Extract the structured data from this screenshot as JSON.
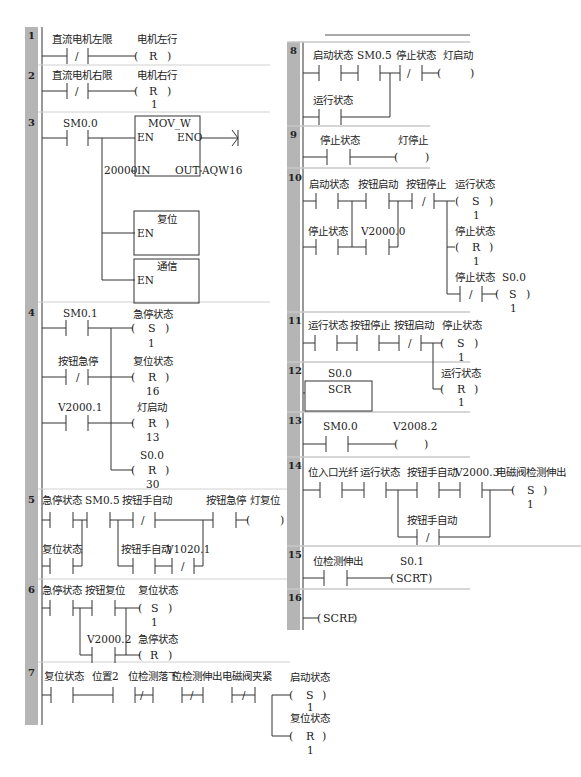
{
  "colors": {
    "gutter": "#b5b5b5",
    "wire": "#333333",
    "text": "#222222",
    "separator": "#c8c8c8"
  },
  "networks": [
    {
      "n": "1",
      "x": 25,
      "y": 27,
      "elements": [
        {
          "type": "contact_nc",
          "label": "直流电机左限",
          "x": 65,
          "y": 45
        },
        {
          "type": "coil",
          "op": "R",
          "label": "电机左行",
          "x": 140,
          "y": 45,
          "param": ""
        }
      ]
    },
    {
      "n": "2",
      "x": 25,
      "y": 67,
      "elements": [
        {
          "type": "contact_nc",
          "label": "直流电机右限",
          "x": 65,
          "y": 88
        },
        {
          "type": "coil",
          "op": "R",
          "label": "电机右行",
          "x": 140,
          "y": 88,
          "param": "1"
        }
      ]
    },
    {
      "n": "3",
      "x": 25,
      "y": 115
    },
    {
      "n": "4",
      "x": 25,
      "y": 305
    },
    {
      "n": "5",
      "x": 25,
      "y": 492
    },
    {
      "n": "6",
      "x": 25,
      "y": 582
    },
    {
      "n": "7",
      "x": 25,
      "y": 665
    },
    {
      "n": "8",
      "x": 287,
      "y": 45
    },
    {
      "n": "9",
      "x": 287,
      "y": 130
    },
    {
      "n": "10",
      "x": 287,
      "y": 175
    },
    {
      "n": "11",
      "x": 287,
      "y": 318
    },
    {
      "n": "12",
      "x": 287,
      "y": 369
    },
    {
      "n": "13",
      "x": 287,
      "y": 419
    },
    {
      "n": "14",
      "x": 287,
      "y": 464
    },
    {
      "n": "15",
      "x": 287,
      "y": 553
    },
    {
      "n": "16",
      "x": 287,
      "y": 596
    }
  ],
  "labels": {
    "n1_contact": "直流电机左限",
    "n1_coil": "电机左行",
    "n1_op": "R",
    "n2_contact": "直流电机右限",
    "n2_coil": "电机右行",
    "n2_op": "R",
    "n2_param": "1",
    "n3_contact": "SM0.0",
    "n3_box1_title": "MOV_W",
    "n3_en": "EN",
    "n3_eno": "ENO",
    "n3_in": "IN",
    "n3_out": "OUT",
    "n3_in_val": "20000",
    "n3_out_val": "AQW16",
    "n3_box2_title": "复位",
    "n3_box3_title": "通信",
    "n4_c1": "SM0.1",
    "n4_c2": "按钮急停",
    "n4_c3": "V2000.1",
    "n4_o1": "急停状态",
    "n4_o1_op": "S",
    "n4_o1_p": "1",
    "n4_o2": "复位状态",
    "n4_o2_op": "R",
    "n4_o2_p": "16",
    "n4_o3": "灯启动",
    "n4_o3_op": "R",
    "n4_o3_p": "13",
    "n4_o4": "S0.0",
    "n4_o4_op": "R",
    "n4_o4_p": "30",
    "n5_c1": "急停状态",
    "n5_c2": "SM0.5",
    "n5_c3": "按钮手自动",
    "n5_c4": "按钮急停",
    "n5_coil": "灯复位",
    "n5_c5": "复位状态",
    "n5_c6": "按钮手自动",
    "n5_c7": "V1020.1",
    "n6_c1": "急停状态",
    "n6_c2": "按钮复位",
    "n6_c3": "V2000.2",
    "n6_o1": "复位状态",
    "n6_o1_op": "S",
    "n6_o1_p": "1",
    "n6_o2": "急停状态",
    "n6_o2_op": "R",
    "n7_c1": "复位状态",
    "n7_c2": "位置2",
    "n7_c3": "位检测落下",
    "n7_c4": "位检测伸出",
    "n7_c5": "电磁阀夹紧",
    "n7_o1": "启动状态",
    "n7_o1_op": "S",
    "n7_o1_p": "1",
    "n7_o2": "复位状态",
    "n7_o2_op": "R",
    "n7_o2_p": "1",
    "n8_c1": "启动状态",
    "n8_c2": "SM0.5",
    "n8_c3": "停止状态",
    "n8_coil": "灯启动",
    "n8_c4": "运行状态",
    "n9_c1": "停止状态",
    "n9_coil": "灯停止",
    "n10_c1": "启动状态",
    "n10_c2": "按钮启动",
    "n10_c3": "按钮停止",
    "n10_c4": "停止状态",
    "n10_c5": "V2000.0",
    "n10_o1": "运行状态",
    "n10_o1_op": "S",
    "n10_o1_p": "1",
    "n10_o2": "停止状态",
    "n10_o2_op": "R",
    "n10_o2_p": "1",
    "n10_c6": "停止状态",
    "n10_o3": "S0.0",
    "n10_o3_op": "S",
    "n10_o3_p": "1",
    "n11_c1": "运行状态",
    "n11_c2": "按钮停止",
    "n11_c3": "按钮启动",
    "n11_o1": "停止状态",
    "n11_o1_op": "S",
    "n11_o1_p": "1",
    "n11_o2": "运行状态",
    "n11_o2_op": "R",
    "n11_o2_p": "1",
    "n12_addr": "S0.0",
    "n12_box": "SCR",
    "n13_c1": "SM0.0",
    "n13_coil": "V2008.2",
    "n14_c1": "位入口光纤",
    "n14_c2": "运行状态",
    "n14_c3": "按钮手自动",
    "n14_c4": "V2000.3",
    "n14_c5": "按钮手自动",
    "n14_o1": "电磁阀检测伸出",
    "n14_o1_op": "S",
    "n14_o1_p": "1",
    "n15_c1": "位检测伸出",
    "n15_addr": "S0.1",
    "n15_coil": "SCRT",
    "n16_coil": "SCRE"
  }
}
